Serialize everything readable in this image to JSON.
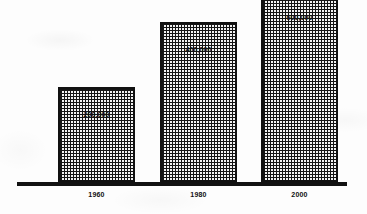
{
  "chart_data": {
    "type": "bar",
    "title": "",
    "subtitle": "",
    "xlabel": "",
    "ylabel": "",
    "categories": [
      "1960",
      "1980",
      "2000"
    ],
    "values": [
      200000,
      400000,
      600000
    ],
    "value_labels": [
      "200,000",
      "400,000",
      "600,000"
    ],
    "series": [
      {
        "name": "",
        "values": [
          200000,
          400000,
          600000
        ]
      }
    ],
    "ylim": [
      0,
      700000
    ],
    "grid": false,
    "legend": false,
    "legend_position": "none",
    "annotations": [],
    "style": {
      "bar_fill": "#f2f2f2",
      "bar_hatch": "crosshatch",
      "bar_border": "#111111",
      "axis_color": "#121212",
      "text_color": "#101010",
      "background": "#ffffff"
    }
  },
  "bars": [
    {
      "category": "1960",
      "value": 200000,
      "label": "200,000"
    },
    {
      "category": "1980",
      "value": 400000,
      "label": "400,000"
    },
    {
      "category": "2000",
      "value": 600000,
      "label": "600,000"
    }
  ]
}
